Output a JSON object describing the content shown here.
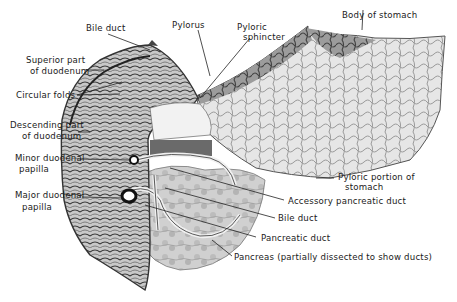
{
  "figure": {
    "style": "grayscale anatomical illustration"
  },
  "labels": {
    "bile_duct_top": "Bile duct",
    "pylorus": "Pylorus",
    "pyloric_sphincter_1": "Pyloric",
    "pyloric_sphincter_2": "sphincter",
    "body_of_stomach": "Body of stomach",
    "superior_part_1": "Superior part",
    "superior_part_2": "of duodenum",
    "circular_folds": "Circular folds",
    "descending_part_1": "Descending part",
    "descending_part_2": "of duodenum",
    "minor_papilla_1": "Minor duodenal",
    "minor_papilla_2": "papilla",
    "major_papilla_1": "Major duodenal",
    "major_papilla_2": "papilla",
    "pyloric_portion_1": "Pyloric portion of",
    "pyloric_portion_2": "stomach",
    "accessory_pancreatic_duct": "Accessory pancreatic duct",
    "bile_duct_lower": "Bile duct",
    "pancreatic_duct": "Pancreatic duct",
    "pancreas": "Pancreas (partially dissected to show ducts)"
  },
  "colors": {
    "ink": "#1a1a1a",
    "tissue_dark": "#3a3a3a",
    "tissue_mid": "#8a8a8a",
    "tissue_light": "#d4d4d4",
    "background": "#ffffff"
  }
}
